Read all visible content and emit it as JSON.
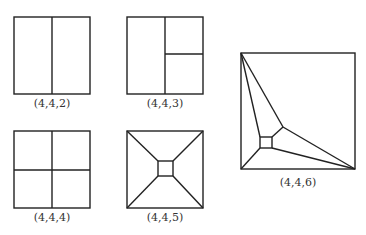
{
  "figures": [
    {
      "id": "442",
      "label": "(4,4,2)",
      "description": "square split into two vertical rectangles"
    },
    {
      "id": "443",
      "label": "(4,4,3)",
      "description": "square split vertically, right half split horizontally"
    },
    {
      "id": "444",
      "label": "(4,4,4)",
      "description": "square split into four quadrants"
    },
    {
      "id": "445",
      "label": "(4,4,5)",
      "description": "square with small central square joined to corners"
    },
    {
      "id": "446",
      "label": "(4,4,6)",
      "description": "square with small inner square and junction point connected to top-left and bottom-right corners"
    }
  ],
  "colors": {
    "stroke": "#222222",
    "label": "#333333",
    "background": "#ffffff"
  }
}
